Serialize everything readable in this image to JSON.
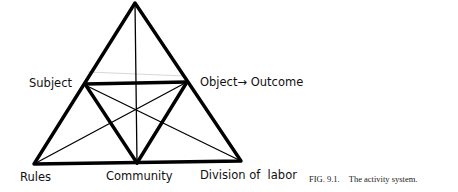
{
  "figure": {
    "nodes": {
      "subject": "Subject",
      "object_outcome": "Object→ Outcome",
      "rules": "Rules",
      "community": "Community",
      "division_of_labor": "Division of  labor"
    },
    "caption": {
      "number": "FIG. 9.1.",
      "title": "The activity system."
    },
    "colors": {
      "line": "#000000",
      "background": "#ffffff"
    }
  }
}
